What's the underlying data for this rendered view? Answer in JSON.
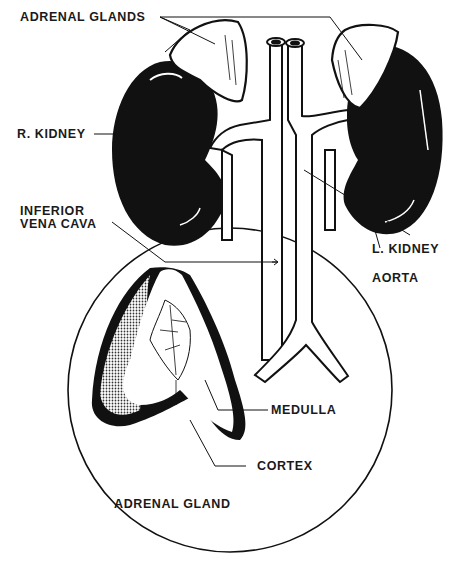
{
  "diagram": {
    "colors": {
      "ink": "#111111",
      "paper": "#ffffff",
      "label": "#1a1a1a",
      "stipple": "#6a6a6a"
    },
    "labels": {
      "adrenal_glands": "ADRENAL GLANDS",
      "r_kidney": "R. KIDNEY",
      "inferior_vena_cava_line1": "INFERIOR",
      "inferior_vena_cava_line2": "VENA CAVA",
      "l_kidney": "L. KIDNEY",
      "aorta": "AORTA",
      "medulla": "MEDULLA",
      "cortex": "CORTEX",
      "inset_title": "ADRENAL GLAND"
    }
  }
}
